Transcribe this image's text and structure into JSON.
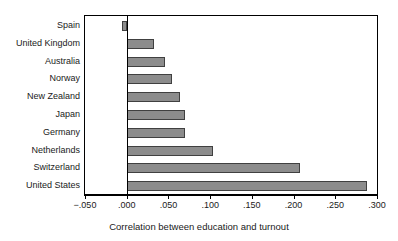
{
  "chart_data": {
    "type": "bar",
    "orientation": "horizontal",
    "title": "",
    "xlabel": "Correlation between education and turnout",
    "ylabel": "",
    "xlim": [
      -0.05,
      0.3
    ],
    "xticks": [
      -0.05,
      0.0,
      0.05,
      0.1,
      0.15,
      0.2,
      0.25,
      0.3
    ],
    "xticklabels": [
      "−.050",
      ".000",
      ".050",
      ".100",
      ".150",
      ".200",
      ".250",
      ".300"
    ],
    "grid": false,
    "legend": null,
    "categories": [
      "Spain",
      "United Kingdom",
      "Australia",
      "Norway",
      "New Zealand",
      "Japan",
      "Germany",
      "Netherlands",
      "Switzerland",
      "United States"
    ],
    "values": [
      -0.006,
      0.033,
      0.046,
      0.054,
      0.064,
      0.07,
      0.07,
      0.103,
      0.208,
      0.288
    ],
    "bar_color": "#8c8c8c",
    "bar_edge_color": "#404040",
    "axis_color": "#000000"
  }
}
